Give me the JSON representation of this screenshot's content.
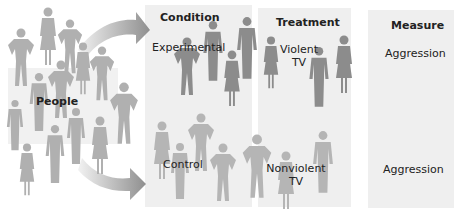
{
  "diagram": {
    "source_label": "People",
    "columns": [
      {
        "header": "Condition",
        "rows": [
          "Experimental",
          "Control"
        ]
      },
      {
        "header": "Treatment",
        "rows": [
          "Violent TV",
          "Nonviolent TV"
        ]
      },
      {
        "header": "Measure",
        "rows": [
          "Aggression",
          "Aggression"
        ]
      }
    ],
    "treatment_lines": {
      "violent_1": "Violent",
      "violent_2": "TV",
      "nonviolent_1": "Nonviolent",
      "nonviolent_2": "TV"
    },
    "arrows": [
      "people-to-experimental",
      "people-to-control"
    ],
    "colors": {
      "panel_bg": "#efefef",
      "figure_dark": "#8a8a8a",
      "figure_light": "#b5b5b5",
      "arrow": "#9a9a9a",
      "text": "#222222"
    }
  }
}
